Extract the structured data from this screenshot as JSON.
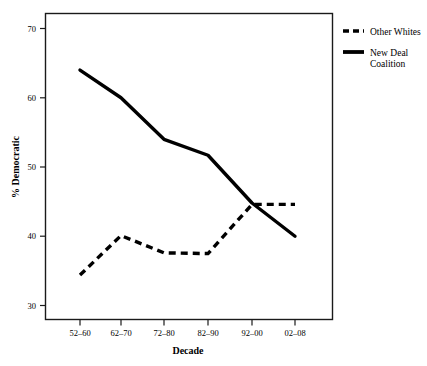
{
  "chart_data": {
    "type": "line",
    "title": "",
    "subtitle": "",
    "xlabel": "Decade",
    "ylabel": "% Democratic",
    "categories": [
      "52–60",
      "62–70",
      "72–80",
      "82–90",
      "92–00",
      "02–08"
    ],
    "xtick_labels": [
      "52–60",
      "62–70",
      "72–80",
      "82–90",
      "92–00",
      "02–08"
    ],
    "ytick_labels": [
      "30",
      "40",
      "50",
      "60",
      "70"
    ],
    "yticks": [
      30,
      40,
      50,
      60,
      70
    ],
    "ylim": [
      28,
      71.5
    ],
    "xlim": [
      0,
      7
    ],
    "grid": false,
    "legend_position": "top-right-outside",
    "series": [
      {
        "name": "Other Whites",
        "style": "dashed",
        "color": "#000000",
        "values": [
          34.4,
          40.1,
          37.6,
          37.5,
          44.6,
          44.6
        ]
      },
      {
        "name": "New Deal Coalition",
        "style": "solid",
        "color": "#000000",
        "values": [
          64.0,
          60.0,
          54.0,
          51.7,
          44.8,
          40.0
        ]
      }
    ],
    "annotations": []
  },
  "legend": {
    "entries": [
      {
        "label": "Other Whites",
        "swatch": "dashed-line-swatch"
      },
      {
        "label_line1": "New Deal",
        "label_line2": "Coalition",
        "swatch": "solid-line-swatch"
      }
    ]
  },
  "axes": {
    "y_axis_title": "% Democratic",
    "x_axis_title": "Decade",
    "y_tick_0": "30",
    "y_tick_1": "40",
    "y_tick_2": "50",
    "y_tick_3": "60",
    "y_tick_4": "70",
    "x_tick_0": "52–60",
    "x_tick_1": "62–70",
    "x_tick_2": "72–80",
    "x_tick_3": "82–90",
    "x_tick_4": "92–00",
    "x_tick_5": "02–08"
  },
  "colors": {
    "background": "#ffffff",
    "frame": "#1a1a1a",
    "series_ink": "#000000"
  }
}
